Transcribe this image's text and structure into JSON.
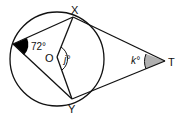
{
  "diagram": {
    "type": "circle-geometry",
    "points": {
      "X": {
        "label": "X"
      },
      "Y": {
        "label": "Y"
      },
      "O": {
        "label": "O"
      },
      "T": {
        "label": "T"
      }
    },
    "angles": {
      "inscribed": {
        "label": "72°",
        "fill": "#000000"
      },
      "central": {
        "label": "j°"
      },
      "tangent": {
        "label": "k°",
        "fill": "#b0b0b0"
      }
    },
    "colors": {
      "stroke": "#111111",
      "background": "#ffffff"
    }
  }
}
